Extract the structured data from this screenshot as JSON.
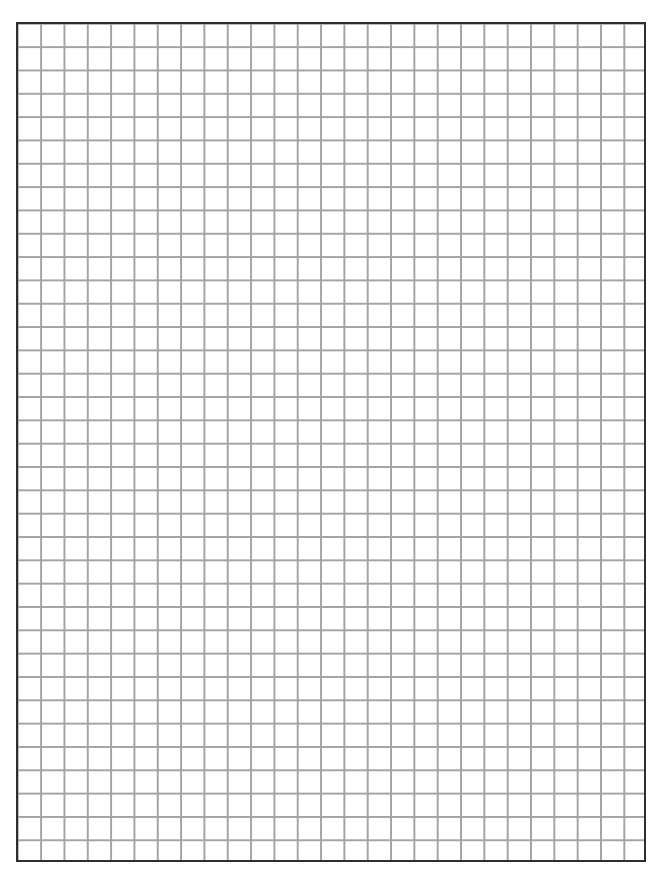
{
  "page": {
    "type": "graph-paper",
    "background_color": "#ffffff"
  },
  "grid": {
    "columns": 27,
    "rows": 36,
    "cell_size_px": 23.33,
    "line_color": "#a3a3a3",
    "border_color": "#2e2e2e"
  }
}
